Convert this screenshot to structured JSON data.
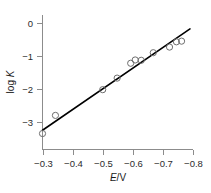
{
  "chart_data": {
    "type": "scatter",
    "title": "",
    "subtitle": "",
    "xlabel": "E/V",
    "xlabel_parts": {
      "italic": "E",
      "rest": "/V"
    },
    "ylabel": "log K",
    "ylabel_parts": {
      "rest": "log ",
      "italic": "K"
    },
    "xlim": [
      -0.3,
      -0.8
    ],
    "ylim": [
      -3.6,
      0.35
    ],
    "x_ticks": [
      -0.3,
      -0.4,
      -0.5,
      -0.6,
      -0.7,
      -0.8
    ],
    "x_tick_labels": [
      "−0.3",
      "−0.4",
      "−0.5",
      "−0.6",
      "−0.7",
      "−0.8"
    ],
    "y_ticks": [
      0,
      -1,
      -2,
      -3
    ],
    "y_tick_labels": [
      "0",
      "−1",
      "−2",
      "−3"
    ],
    "grid": false,
    "legend": null,
    "axis_direction_note": "x axis increases to the left (more negative to the right)",
    "marker": "open-circle",
    "points": [
      {
        "x": -0.3,
        "y": -3.35
      },
      {
        "x": -0.343,
        "y": -2.8
      },
      {
        "x": -0.5,
        "y": -2.02
      },
      {
        "x": -0.548,
        "y": -1.67
      },
      {
        "x": -0.593,
        "y": -1.22
      },
      {
        "x": -0.608,
        "y": -1.12
      },
      {
        "x": -0.628,
        "y": -1.13
      },
      {
        "x": -0.668,
        "y": -0.9
      },
      {
        "x": -0.722,
        "y": -0.73
      },
      {
        "x": -0.745,
        "y": -0.57
      },
      {
        "x": -0.762,
        "y": -0.55
      }
    ],
    "fit_line": {
      "type": "linear",
      "x_start": -0.3,
      "y_start": -3.25,
      "x_end": -0.79,
      "y_end": -0.18
    },
    "colors": {
      "marker_stroke": "#6e6e6e",
      "fit_line": "#000000",
      "axis": "#8c8c8c",
      "text": "#1a1a1a",
      "background": "#ffffff"
    }
  }
}
